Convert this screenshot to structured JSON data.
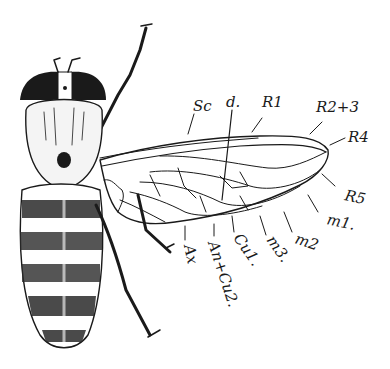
{
  "figure": {
    "labels": [
      {
        "id": "sc",
        "text": "Sc",
        "x": 193,
        "y": 111,
        "rot": 0
      },
      {
        "id": "d",
        "text": "d.",
        "x": 228,
        "y": 107,
        "rot": 0
      },
      {
        "id": "r1",
        "text": "R1",
        "x": 262,
        "y": 107,
        "rot": 0
      },
      {
        "id": "r23",
        "text": "R2+3",
        "x": 316,
        "y": 112,
        "rot": 0
      },
      {
        "id": "r4",
        "text": "R4",
        "x": 348,
        "y": 140,
        "rot": 0
      },
      {
        "id": "r5",
        "text": "R5",
        "x": 344,
        "y": 200,
        "rot": 12
      },
      {
        "id": "m1",
        "text": "m1.",
        "x": 326,
        "y": 224,
        "rot": 12
      },
      {
        "id": "m2",
        "text": "m2",
        "x": 296,
        "y": 245,
        "rot": 18
      },
      {
        "id": "m3",
        "text": "m3.",
        "x": 266,
        "y": 247,
        "rot": 55
      },
      {
        "id": "cu1",
        "text": "Cu1.",
        "x": 233,
        "y": 244,
        "rot": 55
      },
      {
        "id": "an_cu2",
        "text": "An+Cu2.",
        "x": 208,
        "y": 249,
        "rot": 72
      },
      {
        "id": "ax",
        "text": "Ax",
        "x": 185,
        "y": 252,
        "rot": 78
      }
    ]
  }
}
